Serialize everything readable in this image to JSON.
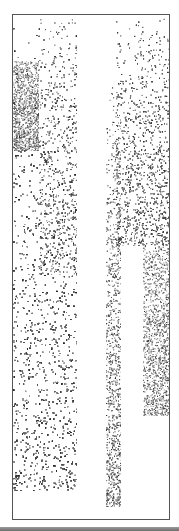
{
  "artwork": {
    "type": "stippled-abstract-print",
    "frame_color": "#555555",
    "ink_color": "#2a2a2a",
    "regions": [
      {
        "name": "left-upper-block",
        "x": 0,
        "y": 46,
        "w": 26,
        "h": 90,
        "density_top": 0.35,
        "density_bottom": 0.7
      },
      {
        "name": "left-column",
        "x": 0,
        "y": 0,
        "w": 64,
        "h": 476,
        "density_top": 0.06,
        "density_bottom": 0.6
      },
      {
        "name": "center-left-sparse",
        "x": 26,
        "y": 0,
        "w": 38,
        "h": 260,
        "density_top": 0.05,
        "density_bottom": 0.25
      },
      {
        "name": "middle-strip",
        "x": 93,
        "y": 60,
        "w": 15,
        "h": 432,
        "density_top": 0.05,
        "density_bottom": 0.6
      },
      {
        "name": "right-upper-block",
        "x": 103,
        "y": 0,
        "w": 55,
        "h": 231,
        "density_top": 0.06,
        "density_bottom": 0.6
      },
      {
        "name": "right-lower-block",
        "x": 130,
        "y": 231,
        "w": 26,
        "h": 170,
        "density_top": 0.3,
        "density_bottom": 0.5
      }
    ]
  }
}
